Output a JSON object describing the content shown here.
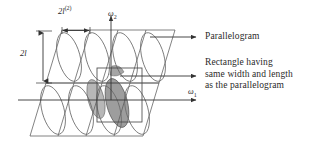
{
  "figure": {
    "kind": "geometry-diagram",
    "background": "#ffffff",
    "stroke_color": "#555555",
    "shade_color": "#9a9a9a",
    "text_color": "#2a2a2a"
  },
  "dimensions": {
    "width_label_base": "2",
    "width_label_var": "l",
    "width_label_sup": "(2)",
    "height_label_base": "2",
    "height_label_var": "l"
  },
  "axes": {
    "horizontal": {
      "symbol": "ω",
      "subscript": "1"
    },
    "vertical": {
      "symbol": "ω",
      "subscript": "2"
    }
  },
  "callouts": [
    {
      "id": "parallelogram",
      "text": "Parallelogram"
    },
    {
      "id": "rectangle",
      "line1": "Rectangle having",
      "line2": "same width and length",
      "line3": "as the parallelogram"
    }
  ],
  "lattice": {
    "columns": 4,
    "rows": 2,
    "shear": -0.3,
    "cell_width": 47,
    "cell_height": 52,
    "origin_x": 118,
    "origin_y": 88,
    "shaded_cells": [
      {
        "row": 1,
        "col": 2
      }
    ],
    "rectangle_overlay": {
      "x": 97,
      "y": 68,
      "w": 45,
      "h": 54
    }
  }
}
